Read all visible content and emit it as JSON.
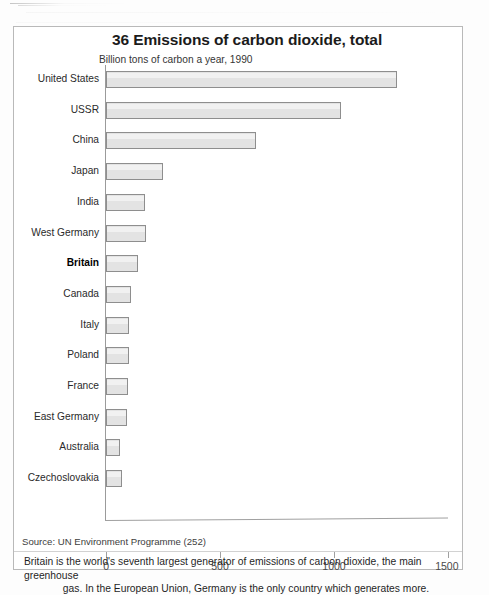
{
  "figure": {
    "title": "36 Emissions of carbon dioxide, total",
    "subtitle": "Billion tons of carbon a year, 1990",
    "source": "Source: UN Environment Programme (252)",
    "footnote_line1": "Britain is the world's seventh largest generator of emissions of carbon dioxide, the main greenhouse",
    "footnote_line2": "gas. In the European Union, Germany is the only country which generates more.",
    "highlight_country": "Britain",
    "colors": {
      "bar_fill": "#e3e3e3",
      "bar_border": "#8e8e8e",
      "frame": "#b9b9b9",
      "axis": "#9b9b9b",
      "text": "#1f1f1f"
    }
  },
  "chart_data": {
    "type": "bar",
    "orientation": "horizontal",
    "title": "36 Emissions of carbon dioxide, total",
    "subtitle": "Billion tons of carbon a year, 1990",
    "xlabel": "",
    "ylabel": "",
    "xlim": [
      0,
      1500
    ],
    "xticks": [
      0,
      500,
      1000,
      1500
    ],
    "xtick_labels": [
      "0",
      "500",
      "1000",
      "1500"
    ],
    "grid": false,
    "legend": null,
    "categories": [
      "United States",
      "USSR",
      "China",
      "Japan",
      "India",
      "West Germany",
      "Britain",
      "Canada",
      "Italy",
      "Poland",
      "France",
      "East Germany",
      "Australia",
      "Czechoslovakia"
    ],
    "values": [
      1275,
      1030,
      660,
      250,
      172,
      175,
      140,
      110,
      100,
      102,
      98,
      90,
      60,
      70
    ],
    "series": [
      {
        "name": "Emissions of carbon dioxide, total",
        "values": [
          1275,
          1030,
          660,
          250,
          172,
          175,
          140,
          110,
          100,
          102,
          98,
          90,
          60,
          70
        ]
      }
    ]
  }
}
